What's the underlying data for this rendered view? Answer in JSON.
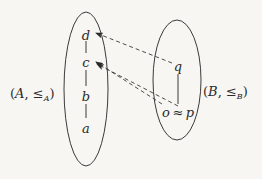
{
  "diagram": {
    "left_set": {
      "label": "(A, ≤A)",
      "label_parts": {
        "open": "(",
        "name": "A",
        "comma": ", ",
        "rel": "≤",
        "sub": "A",
        "close": ")"
      },
      "elements": [
        "d",
        "c",
        "b",
        "a"
      ],
      "order_edges": [
        [
          "d",
          "c"
        ],
        [
          "c",
          "b"
        ],
        [
          "b",
          "a"
        ]
      ]
    },
    "right_set": {
      "label": "(B, ≤B)",
      "label_parts": {
        "open": "(",
        "name": "B",
        "comma": ", ",
        "rel": "≤",
        "sub": "B",
        "close": ")"
      },
      "elements": [
        "q",
        "o",
        "p"
      ],
      "equiv_symbol": "≈",
      "order_edges": [
        [
          "q",
          "p"
        ]
      ]
    },
    "mappings": [
      {
        "from": "q",
        "to": "d",
        "style": "dashed"
      },
      {
        "from": "o",
        "to": "c",
        "style": "dashed"
      },
      {
        "from": "p",
        "to": "c",
        "style": "dashed"
      }
    ],
    "colors": {
      "stroke": "#3a3a3a",
      "background": "#f7f6f2",
      "text": "#2a2a2a"
    }
  }
}
